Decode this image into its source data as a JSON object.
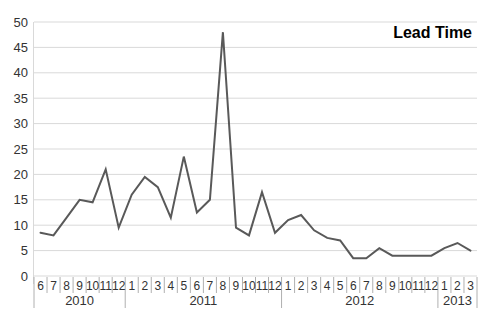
{
  "chart_data": {
    "type": "line",
    "title": "Lead Time",
    "categories": [
      "6",
      "7",
      "8",
      "9",
      "10",
      "11",
      "12",
      "1",
      "2",
      "3",
      "4",
      "5",
      "6",
      "7",
      "8",
      "9",
      "10",
      "11",
      "12",
      "1",
      "2",
      "3",
      "4",
      "5",
      "6",
      "7",
      "8",
      "9",
      "10",
      "11",
      "12",
      "1",
      "2",
      "3"
    ],
    "year_groups": [
      {
        "year": "2010",
        "count": 7
      },
      {
        "year": "2011",
        "count": 12
      },
      {
        "year": "2012",
        "count": 12
      },
      {
        "year": "2013",
        "count": 3
      }
    ],
    "values": [
      8.5,
      8,
      11.5,
      15,
      14.5,
      21,
      9.5,
      16,
      19.5,
      17.5,
      11.5,
      23.5,
      12.5,
      15,
      48,
      9.5,
      8,
      16.5,
      8.5,
      11,
      12,
      9,
      7.5,
      7,
      3.5,
      3.5,
      5.5,
      4,
      4,
      4,
      4,
      5.5,
      6.5,
      5
    ],
    "ylim": [
      0,
      50
    ],
    "ytick_step": 5,
    "grid": true,
    "legend_position": "none",
    "xlabel": "",
    "ylabel": ""
  },
  "colors": {
    "series_line": "#595959",
    "gridline": "#d9d9d9",
    "tick": "#b0b0b0",
    "axis_text": "#333333",
    "title_text": "#000000",
    "background": "#ffffff"
  }
}
